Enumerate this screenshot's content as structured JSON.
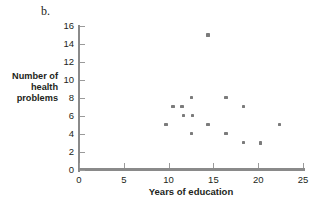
{
  "panel": {
    "letter": "b."
  },
  "chart_data": {
    "type": "scatter",
    "title": "",
    "subtitle": "",
    "xlabel": "Years of education",
    "ylabel": "Number of health problems",
    "ylabel_lines": [
      "Number of",
      "health",
      "problems"
    ],
    "xlim": [
      0,
      25
    ],
    "ylim": [
      0,
      16
    ],
    "xticks": [
      0,
      5,
      10,
      15,
      20,
      25
    ],
    "yticks": [
      0,
      2,
      4,
      6,
      8,
      10,
      12,
      14,
      16
    ],
    "xtick_labels": [
      "0",
      "5",
      "10",
      "15",
      "20",
      "25"
    ],
    "ytick_labels": [
      "0",
      "2",
      "4",
      "6",
      "8",
      "10",
      "12",
      "14",
      "16"
    ],
    "grid": false,
    "legend": null,
    "marker_color": "#7b7b7b",
    "axis_color": "#8a8a8a",
    "points": [
      {
        "x": 9.7,
        "y": 5.1
      },
      {
        "x": 10.5,
        "y": 7.1
      },
      {
        "x": 11.5,
        "y": 7.1
      },
      {
        "x": 11.7,
        "y": 6.1
      },
      {
        "x": 12.6,
        "y": 8.1
      },
      {
        "x": 12.7,
        "y": 6.1
      },
      {
        "x": 12.6,
        "y": 4.1
      },
      {
        "x": 14.4,
        "y": 15.0
      },
      {
        "x": 14.4,
        "y": 5.1
      },
      {
        "x": 16.4,
        "y": 8.1
      },
      {
        "x": 16.4,
        "y": 4.1
      },
      {
        "x": 18.4,
        "y": 7.1
      },
      {
        "x": 18.4,
        "y": 3.1
      },
      {
        "x": 20.3,
        "y": 3.0
      },
      {
        "x": 22.4,
        "y": 5.1
      }
    ]
  }
}
